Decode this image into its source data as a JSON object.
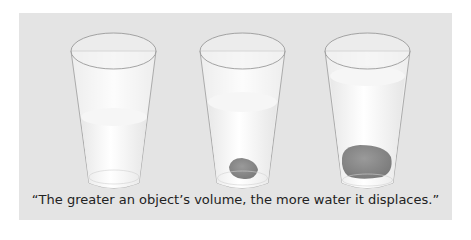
{
  "figure": {
    "caption": "“The greater an object’s volume, the more water it displaces.”",
    "background_color": "#e4e4e4",
    "glasses": [
      {
        "label": "glass-no-object",
        "object": "none",
        "water_level": "low"
      },
      {
        "label": "glass-small-rock",
        "object": "small rock",
        "water_level": "medium"
      },
      {
        "label": "glass-large-rock",
        "object": "large rock",
        "water_level": "high"
      }
    ],
    "colors": {
      "glass_outline": "#9a9a9a",
      "water": "#f4f4f4",
      "rock": "#8a8a8a"
    }
  }
}
